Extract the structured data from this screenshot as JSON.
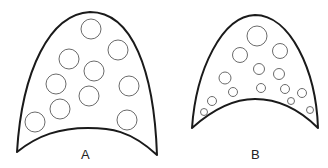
{
  "figures": [
    {
      "label": "A",
      "outline_path": "M 17 152 C 22 70, 50 14, 90 12 C 132 12, 154 70, 157 155 C 130 130, 110 128, 88 128 C 60 128, 38 135, 17 152 Z",
      "circles": [
        {
          "cx": 91,
          "cy": 29,
          "r": 10
        },
        {
          "cx": 118,
          "cy": 50,
          "r": 10
        },
        {
          "cx": 69,
          "cy": 59,
          "r": 10
        },
        {
          "cx": 94,
          "cy": 71,
          "r": 10
        },
        {
          "cx": 56,
          "cy": 84,
          "r": 10
        },
        {
          "cx": 129,
          "cy": 86,
          "r": 10
        },
        {
          "cx": 89,
          "cy": 96,
          "r": 10
        },
        {
          "cx": 60,
          "cy": 109,
          "r": 10
        },
        {
          "cx": 127,
          "cy": 120,
          "r": 10
        },
        {
          "cx": 35,
          "cy": 122,
          "r": 10
        }
      ],
      "label_pos": {
        "x": 81,
        "y": 147
      }
    },
    {
      "label": "B",
      "outline_path": "M 192 128 C 196 70, 222 16, 255 15 C 290 15, 316 70, 318 128 C 300 110, 280 99, 255 99 C 232 99, 212 110, 192 128 Z",
      "circles": [
        {
          "cx": 257,
          "cy": 36,
          "r": 10
        },
        {
          "cx": 240,
          "cy": 55,
          "r": 7.5
        },
        {
          "cx": 280,
          "cy": 51,
          "r": 7.5
        },
        {
          "cx": 259,
          "cy": 69,
          "r": 5.5
        },
        {
          "cx": 279,
          "cy": 74,
          "r": 5.5
        },
        {
          "cx": 225,
          "cy": 78,
          "r": 6
        },
        {
          "cx": 233,
          "cy": 92,
          "r": 4.5
        },
        {
          "cx": 261,
          "cy": 88,
          "r": 4.5
        },
        {
          "cx": 285,
          "cy": 89,
          "r": 4.5
        },
        {
          "cx": 302,
          "cy": 93,
          "r": 4.5
        },
        {
          "cx": 212,
          "cy": 101,
          "r": 4.5
        },
        {
          "cx": 291,
          "cy": 101,
          "r": 3.5
        },
        {
          "cx": 204,
          "cy": 112,
          "r": 3.5
        },
        {
          "cx": 310,
          "cy": 110,
          "r": 3.5
        }
      ],
      "label_pos": {
        "x": 251,
        "y": 147
      }
    }
  ]
}
